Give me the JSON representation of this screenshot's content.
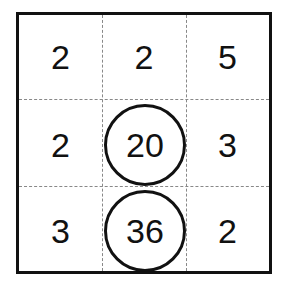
{
  "puzzle": {
    "rows": [
      [
        "2",
        "2",
        "5"
      ],
      [
        "2",
        "20",
        "3"
      ],
      [
        "3",
        "36",
        "2"
      ]
    ],
    "circled": [
      [
        1,
        1
      ],
      [
        2,
        1
      ]
    ]
  }
}
